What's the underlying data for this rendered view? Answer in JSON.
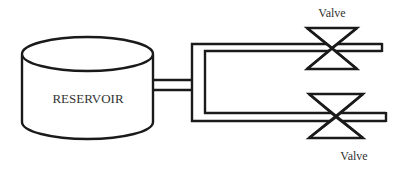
{
  "diagram": {
    "type": "piping-schematic",
    "colors": {
      "stroke": "#1a1a1a",
      "text": "#333333",
      "background": "#ffffff"
    },
    "reservoir": {
      "label": "RESERVOIR",
      "shape": "cylinder-icon"
    },
    "valves": [
      {
        "label": "Valve",
        "position": "top-branch",
        "shape": "gate-valve-icon"
      },
      {
        "label": "Valve",
        "position": "bottom-branch",
        "shape": "gate-valve-icon"
      }
    ],
    "pipes": [
      {
        "name": "reservoir-outlet",
        "from": "reservoir",
        "to": "manifold"
      },
      {
        "name": "manifold",
        "orientation": "vertical"
      },
      {
        "name": "top-branch",
        "to": "valve-top"
      },
      {
        "name": "bottom-branch",
        "to": "valve-bottom"
      }
    ]
  }
}
